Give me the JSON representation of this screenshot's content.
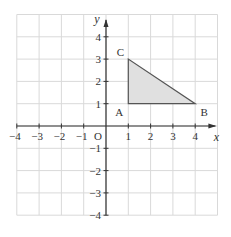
{
  "diagram": {
    "axes": {
      "x_label": "x",
      "y_label": "y",
      "origin_label": "O",
      "x_ticks": [
        "−4",
        "−3",
        "−2",
        "−1",
        "1",
        "2",
        "3",
        "4"
      ],
      "y_ticks": [
        "4",
        "3",
        "2",
        "1",
        "−1",
        "−2",
        "−3",
        "−4"
      ],
      "x_range": [
        -4,
        4
      ],
      "y_range": [
        -4,
        4
      ]
    },
    "triangle": {
      "vertices": [
        {
          "label": "A",
          "x": 1,
          "y": 1
        },
        {
          "label": "B",
          "x": 4,
          "y": 1
        },
        {
          "label": "C",
          "x": 1,
          "y": 3
        }
      ],
      "fill_color": "#e0e0e0",
      "stroke_color": "#555555"
    },
    "colors": {
      "grid": "#d9d9d9",
      "axis": "#333333",
      "text": "#333333"
    }
  }
}
